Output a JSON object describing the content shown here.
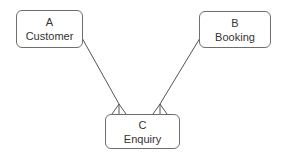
{
  "diagram": {
    "type": "entity-relationship",
    "entities": [
      {
        "id": "A",
        "letter": "A",
        "name": "Customer"
      },
      {
        "id": "B",
        "letter": "B",
        "name": "Booking"
      },
      {
        "id": "C",
        "letter": "C",
        "name": "Enquiry"
      }
    ],
    "relationships": [
      {
        "from": "A",
        "to": "C",
        "from_cardinality": "one",
        "to_cardinality": "many"
      },
      {
        "from": "B",
        "to": "C",
        "from_cardinality": "one",
        "to_cardinality": "many"
      }
    ],
    "colors": {
      "line": "#555555",
      "border": "#6e6e6e",
      "text": "#333333"
    }
  }
}
